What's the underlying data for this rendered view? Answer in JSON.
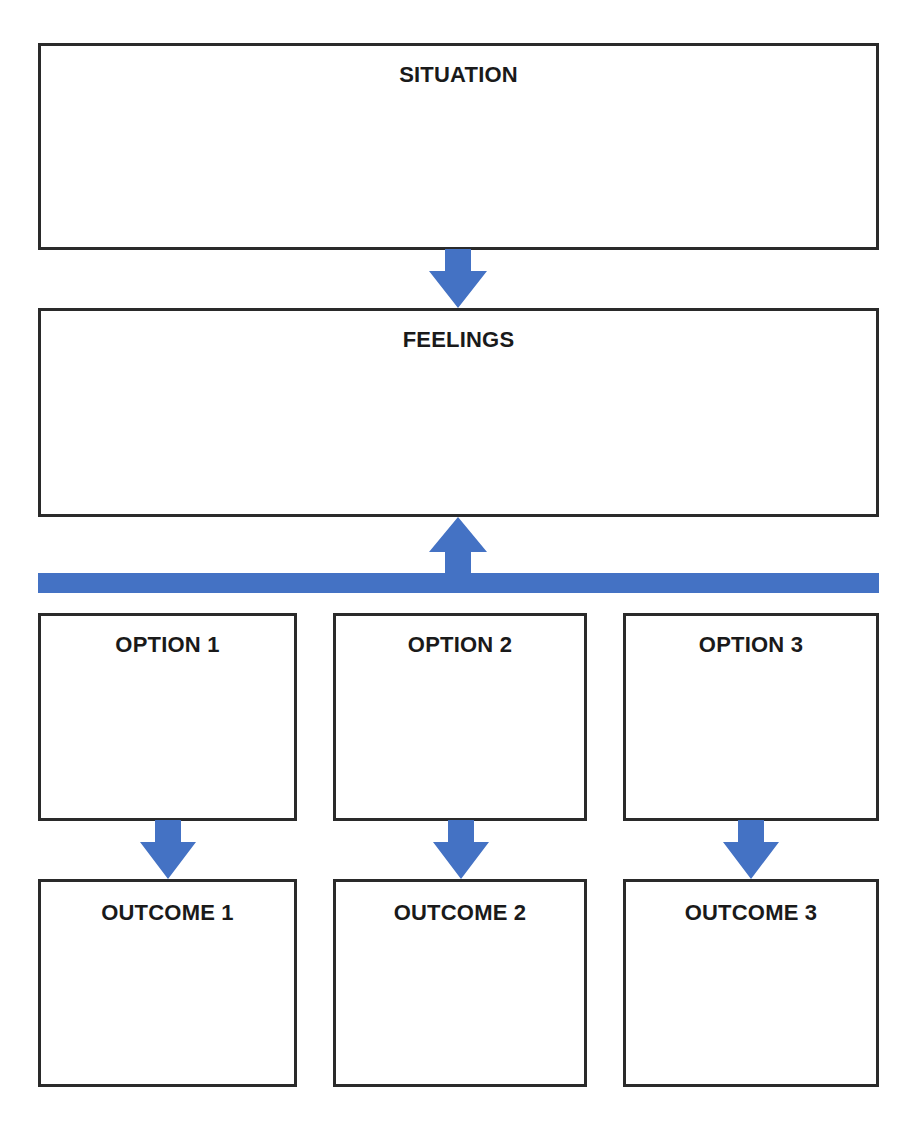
{
  "diagram": {
    "situation": {
      "label": "SITUATION"
    },
    "feelings": {
      "label": "FEELINGS"
    },
    "options": [
      {
        "label": "OPTION 1"
      },
      {
        "label": "OPTION 2"
      },
      {
        "label": "OPTION 3"
      }
    ],
    "outcomes": [
      {
        "label": "OUTCOME 1"
      },
      {
        "label": "OUTCOME 2"
      },
      {
        "label": "OUTCOME 3"
      }
    ],
    "colors": {
      "arrow": "#4472c4",
      "border": "#2a2a2a"
    }
  }
}
